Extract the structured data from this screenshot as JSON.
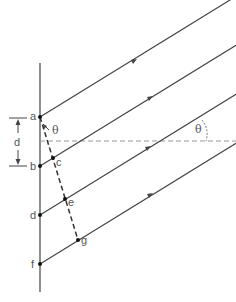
{
  "diagram": {
    "colors": {
      "line": "#444444",
      "dashed": "#999999",
      "label": "#555555",
      "background": "#ffffff"
    },
    "points": [
      {
        "id": "a",
        "label": "a"
      },
      {
        "id": "b",
        "label": "b"
      },
      {
        "id": "c",
        "label": "c"
      },
      {
        "id": "d",
        "label": "d"
      },
      {
        "id": "e",
        "label": "e"
      },
      {
        "id": "f",
        "label": "f"
      },
      {
        "id": "g",
        "label": "g"
      }
    ],
    "spacing_label": "d",
    "angle_label_near": "θ",
    "angle_label_far": "θ"
  }
}
